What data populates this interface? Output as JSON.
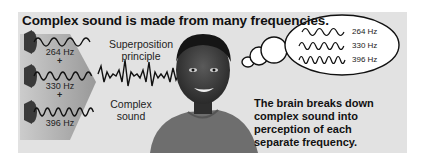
{
  "title": "Complex sound is made from many frequencies.",
  "left_panel": {
    "tones": [
      {
        "frequency": "264 Hz",
        "icon": "speaker-icon"
      },
      {
        "frequency": "330 Hz",
        "icon": "speaker-icon"
      },
      {
        "frequency": "396 Hz",
        "icon": "speaker-icon"
      }
    ],
    "plus_sign": "+"
  },
  "middle": {
    "top_label_line1": "Superposition",
    "top_label_line2": "principle",
    "bottom_label_line1": "Complex",
    "bottom_label_line2": "sound"
  },
  "thought_bubble": {
    "frequencies": [
      "264 Hz",
      "330 Hz",
      "396 Hz"
    ]
  },
  "caption": {
    "lines": [
      "The brain breaks down",
      "complex sound into",
      "perception of each",
      "separate frequency."
    ]
  },
  "colors": {
    "background": "#e2e2e2",
    "wedge": "#9a9a9a",
    "wave": "#111111",
    "bubble_fill": "#ffffff"
  }
}
